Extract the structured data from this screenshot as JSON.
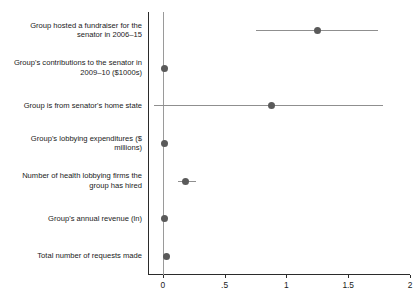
{
  "chart_data": {
    "type": "scatter",
    "title": "",
    "subtitle": "",
    "xlabel": "",
    "ylabel": "",
    "xlim": [
      -0.12,
      2.0
    ],
    "grid": false,
    "legend": null,
    "orientation": "horizontal",
    "zero_reference_line": 0,
    "xticks": [
      {
        "value": 0,
        "label": "0"
      },
      {
        "value": 0.5,
        "label": ".5"
      },
      {
        "value": 1,
        "label": "1"
      },
      {
        "value": 1.5,
        "label": "1.5"
      },
      {
        "value": 2,
        "label": "2"
      }
    ],
    "categories": [
      "Group hosted a fundraiser for the senator in 2006–15",
      "Group's contributions to the senator in 2009–10 ($1000s)",
      "Group is from senator's home state",
      "Group's lobbying expenditures ($ millions)",
      "Number of health lobbying firms the group has hired",
      "Group's annual revenue (ln)",
      "Total number of requests made"
    ],
    "points": [
      {
        "label": "Group hosted a fundraiser for the senator in 2006–15",
        "estimate": 1.25,
        "ci_low": 0.75,
        "ci_high": 1.74
      },
      {
        "label": "Group's contributions to the senator in 2009–10 ($1000s)",
        "estimate": 0.01,
        "ci_low": 0.0,
        "ci_high": 0.02
      },
      {
        "label": "Group is from senator's home state",
        "estimate": 0.88,
        "ci_low": -0.07,
        "ci_high": 1.78
      },
      {
        "label": "Group's lobbying expenditures ($ millions)",
        "estimate": 0.01,
        "ci_low": -0.01,
        "ci_high": 0.03
      },
      {
        "label": "Number of health lobbying firms the group has hired",
        "estimate": 0.18,
        "ci_low": 0.12,
        "ci_high": 0.27
      },
      {
        "label": "Group's annual revenue (ln)",
        "estimate": 0.01,
        "ci_low": -0.01,
        "ci_high": 0.03
      },
      {
        "label": "Total number of requests made",
        "estimate": 0.03,
        "ci_low": 0.02,
        "ci_high": 0.04
      }
    ],
    "colors": {
      "point": "#5a5a5a",
      "ci": "#8f8f8f",
      "axis": "#2b2b2b",
      "zero_line": "#9a9a9a",
      "background": "#ffffff",
      "text": "#1a1a1a"
    }
  }
}
